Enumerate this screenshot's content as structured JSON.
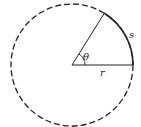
{
  "diagram": {
    "labels": {
      "angle": "θ",
      "arc": "s",
      "radius": "r"
    },
    "angle_degrees": 58,
    "colors": {
      "stroke": "#222222",
      "background": "#ffffff"
    }
  }
}
